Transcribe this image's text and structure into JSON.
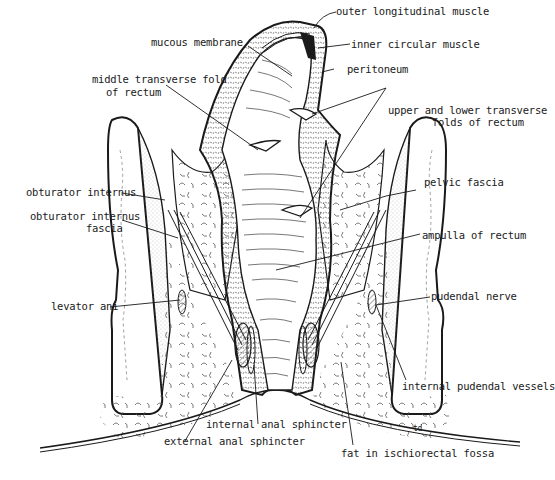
{
  "diagram": {
    "colors": {
      "ink": "#1a1a1a",
      "background": "#ffffff",
      "stipple": "#9a9a9a"
    },
    "labels": {
      "mucous_membrane": "mucous membrane",
      "outer_longitudinal_muscle": "outer longitudinal muscle",
      "inner_circular_muscle": "inner circular muscle",
      "middle_transverse_fold_line1": "middle transverse fold",
      "middle_transverse_fold_line2": "of rectum",
      "peritoneum": "peritoneum",
      "upper_lower_folds_line1": "upper and lower transverse",
      "upper_lower_folds_line2": "folds of rectum",
      "obturator_internus": "obturator internus",
      "pelvic_fascia": "pelvic fascia",
      "obturator_internus_fascia_line1": "obturator internus",
      "obturator_internus_fascia_line2": "fascia",
      "ampulla_of_rectum": "ampulla of rectum",
      "levator_ani": "levator ani",
      "pudendal_nerve": "pudendal nerve",
      "internal_pudendal_vessels": "internal pudendal vessels",
      "internal_anal_sphincter": "internal anal sphincter",
      "external_anal_sphincter": "external anal sphincter",
      "fat_in_ischiorectal_fossa": "fat in ischiorectal fossa",
      "artist_initials": "td"
    }
  }
}
